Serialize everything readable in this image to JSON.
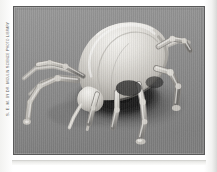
{
  "page": {
    "background_color": "#fdfdfc",
    "width": 217,
    "height": 172
  },
  "credit": {
    "text": "S. E. M. by Dr. Moulin Science Photo Library",
    "orientation": "rotated-90-ccw",
    "color": "#5d5d5d"
  },
  "figure": {
    "name": "sem-tick-micrograph",
    "caption": "",
    "alt": "Scanning electron micrograph of a tick",
    "frame_border_color": "#5a5a5a",
    "background_color": "#8b8b8b",
    "technique": "scanning electron micrograph",
    "palette": {
      "background_gray": "#8b8b8b",
      "shadow_black": "#121212",
      "body_highlight": "#ededea",
      "body_midtone": "#b9b7b2",
      "leg_highlight": "#dedcd8",
      "leg_shadow": "#6a6a6a",
      "surface_gray": "#909090"
    }
  },
  "bottom_rule": {
    "name": "bottom-rule",
    "color": "#d4d4d1"
  }
}
